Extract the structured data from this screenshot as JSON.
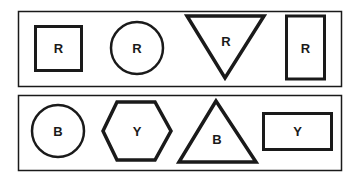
{
  "panels": [
    {
      "name": "top-row",
      "shapes": [
        {
          "shape": "square",
          "label": "R"
        },
        {
          "shape": "circle",
          "label": "R"
        },
        {
          "shape": "inverted-triangle",
          "label": "R"
        },
        {
          "shape": "tall-rectangle",
          "label": "R"
        }
      ]
    },
    {
      "name": "bottom-row",
      "shapes": [
        {
          "shape": "circle",
          "label": "B"
        },
        {
          "shape": "hexagon",
          "label": "Y"
        },
        {
          "shape": "triangle",
          "label": "B"
        },
        {
          "shape": "wide-rectangle",
          "label": "Y"
        }
      ]
    }
  ],
  "colors": {
    "stroke": "#1a1a1a",
    "background": "#ffffff"
  }
}
